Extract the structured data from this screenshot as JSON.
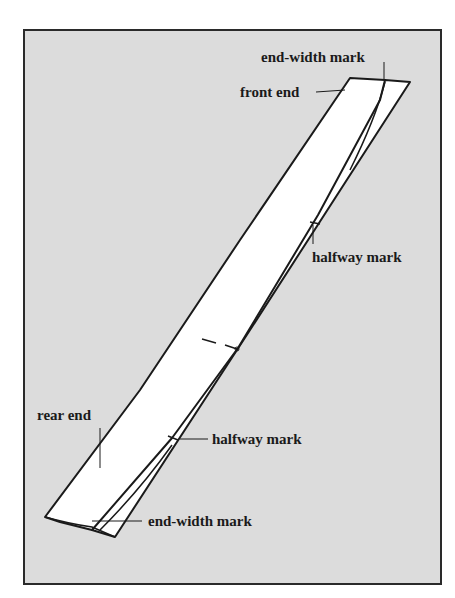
{
  "figure": {
    "background_color": "#dcdcdc",
    "strip_color": "#ffffff",
    "line_color": "#1a1a1a"
  },
  "labels": {
    "top_end_width_mark": "end-width mark",
    "front_end": "front end",
    "top_halfway_mark": "halfway mark",
    "rear_end": "rear end",
    "bottom_halfway_mark": "halfway mark",
    "bottom_end_width_mark": "end-width mark"
  }
}
